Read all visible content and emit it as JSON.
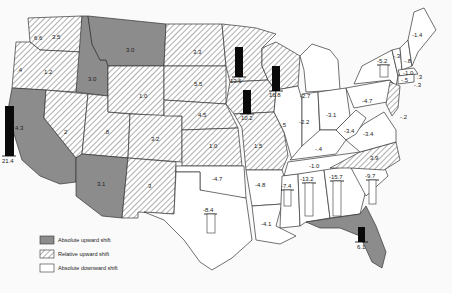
{
  "map": {
    "title": "",
    "legend": [
      {
        "key": "absolute_up",
        "label": "Absolute upward shift",
        "fill": "#8a8a8a"
      },
      {
        "key": "relative_up",
        "label": "Relative upward shift",
        "fill": "hatched"
      },
      {
        "key": "absolute_down",
        "label": "Absolute downward shift",
        "fill": "#ffffff"
      }
    ],
    "states": {
      "WA": {
        "value": "3.5",
        "category": "relative_up"
      },
      "WA_small": {
        "value": "6.6",
        "category": "relative_up"
      },
      "OR": {
        "value": "1.2",
        "category": "relative_up"
      },
      "OR_coast": {
        "value": ".4",
        "category": "relative_up"
      },
      "CA": {
        "value": "21.4",
        "category": "absolute_up",
        "bar": "up"
      },
      "CA_coast": {
        "value": "4.3",
        "category": "absolute_up"
      },
      "ID": {
        "value": "3.0",
        "category": "absolute_up"
      },
      "MT": {
        "value": "3.0",
        "category": "absolute_up"
      },
      "NV": {
        "value": "2",
        "category": "relative_up"
      },
      "UT": {
        "value": ".8",
        "category": "relative_up"
      },
      "AZ": {
        "value": "3.1",
        "category": "absolute_up"
      },
      "WY": {
        "value": "1.0",
        "category": "relative_up"
      },
      "CO": {
        "value": "3.2",
        "category": "relative_up"
      },
      "NM": {
        "value": "3",
        "category": "relative_up"
      },
      "ND": {
        "value": "3.3",
        "category": "relative_up"
      },
      "SD": {
        "value": "5.5",
        "category": "relative_up"
      },
      "NE": {
        "value": "4.5",
        "category": "relative_up"
      },
      "KS": {
        "value": "1.0",
        "category": "relative_up"
      },
      "MN": {
        "value": "13.6",
        "category": "relative_up",
        "bar": "up"
      },
      "IA": {
        "value": "10.2",
        "category": "relative_up",
        "bar": "up"
      },
      "MO": {
        "value": "1.5",
        "category": "relative_up"
      },
      "WI": {
        "value": "16.8",
        "category": "relative_up",
        "bar": "up"
      },
      "IL": {
        "value": "-.5",
        "category": "absolute_down"
      },
      "MI": {
        "value": "-2.7",
        "category": "absolute_down"
      },
      "IN": {
        "value": "-2.2",
        "category": "absolute_down"
      },
      "OH": {
        "value": "-3.1",
        "category": "absolute_down"
      },
      "KY": {
        "value": "-.4",
        "category": "absolute_down"
      },
      "WV": {
        "value": "-3.4",
        "category": "absolute_down"
      },
      "VA": {
        "value": "-3.4",
        "category": "absolute_down"
      },
      "PA": {
        "value": "-4.7",
        "category": "absolute_down"
      },
      "NY": {
        "value": "-5.2",
        "category": "absolute_down",
        "bar": "down"
      },
      "VT": {
        "value": "-.3",
        "category": "absolute_down"
      },
      "NH": {
        "value": "-.8",
        "category": "absolute_down"
      },
      "ME": {
        "value": "-1.4",
        "category": "absolute_down"
      },
      "MA": {
        "value": "-1.0",
        "category": "absolute_down"
      },
      "CT": {
        "value": "-.5",
        "category": "absolute_down"
      },
      "RI": {
        "value": "-.3",
        "category": "absolute_down"
      },
      "MA_small": {
        "value": ".3",
        "category": "absolute_down"
      },
      "DE": {
        "value": "-.2",
        "category": "absolute_down"
      },
      "NC": {
        "value": "3.9",
        "category": "relative_up"
      },
      "TN": {
        "value": "-1.0",
        "category": "absolute_down"
      },
      "OK": {
        "value": "-4.7",
        "category": "absolute_down"
      },
      "TX": {
        "value": "-8.4",
        "category": "absolute_down",
        "bar": "down"
      },
      "AR": {
        "value": "-4.8",
        "category": "absolute_down"
      },
      "LA": {
        "value": "-4.1",
        "category": "absolute_down"
      },
      "MS": {
        "value": "-7.4",
        "category": "absolute_down",
        "bar": "down"
      },
      "AL": {
        "value": "-13.2",
        "category": "absolute_down",
        "bar": "down"
      },
      "GA": {
        "value": "-15.7",
        "category": "absolute_down",
        "bar": "down"
      },
      "SC": {
        "value": "-9.7",
        "category": "absolute_down",
        "bar": "down"
      },
      "FL": {
        "value": "6.1",
        "category": "absolute_up",
        "bar": "up"
      }
    },
    "colors": {
      "absolute_up": "#8c8c8c",
      "hatch_line": "#9a9a9a",
      "border": "#333333",
      "bar": "#0a0a0a",
      "background": "#fafafa"
    }
  }
}
